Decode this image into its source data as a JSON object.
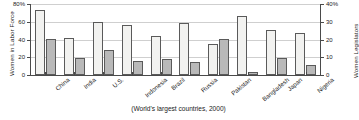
{
  "chart_data": {
    "type": "bar",
    "title": "",
    "caption": "(World's largest countries, 2000)",
    "categories": [
      "China",
      "India",
      "U.S.",
      "Indonesia",
      "Brazil",
      "Russia",
      "Pakistan",
      "Bangladesh",
      "Japan",
      "Nigeria"
    ],
    "series": [
      {
        "name": "Women in Labor Force",
        "axis": "left",
        "color": "#f2f2f0",
        "values": [
          73,
          42,
          60,
          56,
          44,
          59,
          35,
          66,
          51,
          47
        ]
      },
      {
        "name": "Women Legislators",
        "axis": "right",
        "color": "#b9b9b9",
        "values": [
          20.5,
          9.5,
          14,
          8,
          9,
          7.5,
          20.5,
          1.5,
          9.5,
          5.5
        ]
      }
    ],
    "xlabel": "",
    "ylabel": "Women in Labor Force",
    "y2label": "Women Legislators",
    "ylim": [
      0,
      80
    ],
    "y2lim": [
      0,
      40
    ],
    "yticks": [
      "0",
      "20",
      "40",
      "60",
      "80%"
    ],
    "ytick_values": [
      0,
      20,
      40,
      60,
      80
    ],
    "y2ticks": [
      "0",
      "10",
      "20",
      "30",
      "40%"
    ],
    "y2tick_values": [
      0,
      10,
      20,
      30,
      40
    ],
    "grid": true,
    "legend": "none"
  }
}
